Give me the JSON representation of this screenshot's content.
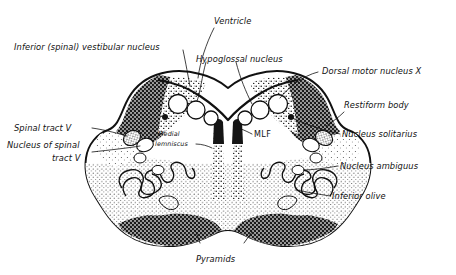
{
  "figure": {
    "style": "hand-drawn ink stipple drawing, black on white",
    "background_color": "#ffffff",
    "ink_color": "#111111"
  },
  "labels": {
    "ventricle": "Ventricle",
    "inferior_vestibular_nucleus": "Inferior (spinal) vestibular nucleus",
    "hypoglossal_nucleus": "Hypoglossal nucleus",
    "dorsal_motor_nucleus_x": "Dorsal motor nucleus X",
    "restiform_body": "Restiform body",
    "nucleus_solitarius": "Nucleus solitarius",
    "nucleus_ambiguus": "Nucleus ambiguus",
    "inferior_olive": "Inferior olive",
    "spinal_tract_v": "Spinal tract V",
    "nucleus_of_spinal_tract_v_line1": "Nucleus of spinal",
    "nucleus_of_spinal_tract_v_line2": "tract V",
    "medial_lemniscus_line1": "Medial",
    "medial_lemniscus_line2": "lemniscus",
    "mlf": "MLF",
    "pyramids": "Pyramids"
  },
  "structures": [
    {
      "name": "restiform-body",
      "shading": "dark-stipple",
      "side": "bilateral"
    },
    {
      "name": "inferior-vestibular-nucleus",
      "shading": "medium-stipple",
      "side": "bilateral"
    },
    {
      "name": "spinal-tract-v",
      "shading": "gray-oval",
      "side": "bilateral"
    },
    {
      "name": "nucleus-of-spinal-tract-v",
      "shading": "outline-oval",
      "side": "bilateral"
    },
    {
      "name": "inferior-olive",
      "shading": "wavy-band-in-stipple",
      "side": "bilateral"
    },
    {
      "name": "medial-lemniscus",
      "shading": "vertical-stipple-column",
      "side": "bilateral"
    },
    {
      "name": "mlf",
      "shading": "dark-vertical-column",
      "side": "bilateral"
    },
    {
      "name": "pyramids",
      "shading": "dark-stipple",
      "side": "bilateral"
    },
    {
      "name": "fourth-ventricle-floor",
      "shading": "outline",
      "side": "midline"
    },
    {
      "name": "nucleus-ambiguus",
      "shading": "small-outline-oval",
      "side": "bilateral"
    },
    {
      "name": "nucleus-solitarius",
      "shading": "small-circle",
      "side": "bilateral"
    },
    {
      "name": "hypoglossal-nucleus",
      "shading": "circle",
      "side": "bilateral"
    }
  ]
}
